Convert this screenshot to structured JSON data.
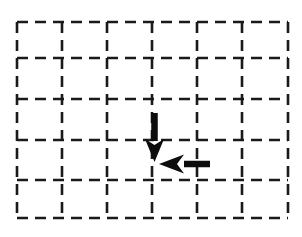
{
  "figure": {
    "width": 302,
    "height": 237,
    "background_color": "#ffffff"
  },
  "grid": {
    "line_color": "#1a1a1a",
    "line_width": 2.6,
    "dash_pattern": "11 7",
    "columns": 6,
    "rows": 5,
    "x_positions": [
      17,
      62,
      107,
      152,
      197,
      242,
      288
    ],
    "y_positions": [
      22,
      58,
      99,
      140,
      180,
      218
    ]
  },
  "arrows": [
    {
      "name": "down-arrow",
      "direction": "down",
      "color": "#0d0d0d",
      "shaft_x": 154.5,
      "shaft_start_y": 113,
      "shaft_end_y": 141,
      "shaft_width": 6.5,
      "head_tip_y": 162,
      "head_half_width": 9.5,
      "head_length": 23,
      "head_notch": 6
    },
    {
      "name": "left-arrow",
      "direction": "left",
      "color": "#0d0d0d",
      "shaft_y": 164,
      "shaft_start_x": 210,
      "shaft_end_x": 184,
      "shaft_width": 6.5,
      "head_tip_x": 159,
      "head_half_width": 9.5,
      "head_length": 25,
      "head_notch": 7
    }
  ]
}
